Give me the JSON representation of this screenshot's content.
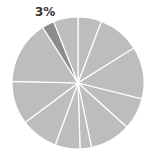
{
  "chart_data": {
    "type": "pie",
    "title": "",
    "start_angle_deg": 0,
    "direction": "clockwise",
    "values": [
      5.8,
      10.3,
      12.8,
      7.8,
      10.0,
      2.8,
      6.1,
      9.2,
      10.6,
      15.6,
      3.0,
      6.0
    ],
    "colors": [
      "#bdbdbd",
      "#bdbdbd",
      "#bdbdbd",
      "#bdbdbd",
      "#bdbdbd",
      "#bdbdbd",
      "#bdbdbd",
      "#bdbdbd",
      "#bdbdbd",
      "#bdbdbd",
      "#8c8c8c",
      "#bdbdbd"
    ],
    "highlighted_index": 10,
    "annotations": [
      {
        "slice_index": 10,
        "text": "3%"
      }
    ],
    "separator_color": "#ffffff",
    "legend": "none"
  },
  "label": "3%"
}
